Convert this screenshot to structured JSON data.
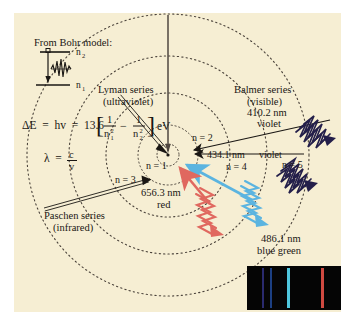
{
  "figure": {
    "background_color": "#f6eed3",
    "ink_color": "#1a1714"
  },
  "bohr_inset": {
    "heading": "From Bohr model:",
    "upper_level_label": "n2",
    "lower_level_label": "n1",
    "photon_icon": "photon-wave-icon",
    "electron_icon": "electron-dot-icon",
    "transition_arrow_icon": "down-arrow-icon"
  },
  "equations": {
    "energy": {
      "lhs": "ΔE  =  hv  =  13.6",
      "bracket_open": "[",
      "term1_num": "1",
      "term1_den": "n",
      "term1_den_sub": "1",
      "term1_den_sup": "2",
      "minus": "−",
      "term2_num": "1",
      "term2_den": "n",
      "term2_den_sub": "2",
      "term2_den_sup": "2",
      "bracket_close": "]",
      "units": "eV",
      "plain": "ΔE = hv = 13.6[1/n₁² − 1/n₂²] eV"
    },
    "wavelength": {
      "lhs": "λ  =",
      "num": "c",
      "den": "v",
      "plain": "λ = c/v"
    }
  },
  "orbits": [
    {
      "label": "n = 1",
      "n": 1,
      "radius": 11
    },
    {
      "label": "n = 2",
      "n": 2,
      "radius": 30
    },
    {
      "label": "n = 3",
      "n": 3,
      "radius": 62
    },
    {
      "label": "n = 4",
      "n": 4,
      "radius": 99
    },
    {
      "label": "n = 5",
      "n": 5,
      "radius": 141
    }
  ],
  "series": [
    {
      "name": "Lyman series",
      "qualifier": "(ultraviolet)",
      "region": "ultraviolet",
      "arrow_color": "#1a1714",
      "transitions": "to n = 1"
    },
    {
      "name": "Balmer series",
      "qualifier": "(visible)",
      "region": "visible",
      "arrow_color": "#1a1714",
      "transitions": "to n = 2"
    },
    {
      "name": "Paschen series",
      "qualifier": "(infrared)",
      "region": "infrared",
      "arrow_color": "#1a1714",
      "transitions": "to n = 3"
    }
  ],
  "emission_lines": [
    {
      "wavelength": "656.3 nm",
      "color_name": "red",
      "color": "#e0685f",
      "transition": "n = 3 → n = 2"
    },
    {
      "wavelength": "486.1 nm",
      "color_name": "blue green",
      "color": "#5bb4e0",
      "transition": "n = 4 → n = 2"
    },
    {
      "wavelength": "434.1 nm",
      "color_name": "violet",
      "color": "#241f4a",
      "transition": "n = 5 → n = 2"
    },
    {
      "wavelength": "410.2 nm",
      "color_name": "violet",
      "color": "#241f4a",
      "transition": "n = 6 → n = 2"
    }
  ],
  "spectrum_inset": {
    "background": "#050505",
    "lines": [
      {
        "color": "#2a2a6e",
        "label": "410.2 nm violet",
        "x_frac": 0.17
      },
      {
        "color": "#1c3f82",
        "label": "434.1 nm violet",
        "x_frac": 0.25
      },
      {
        "color": "#4fc6dd",
        "label": "486.1 nm blue green",
        "x_frac": 0.43
      },
      {
        "color": "#cf4a41",
        "label": "656.3 nm red",
        "x_frac": 0.79
      }
    ]
  }
}
